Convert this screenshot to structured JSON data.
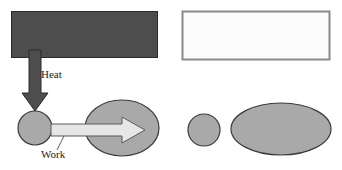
{
  "figure": {
    "title": "",
    "width": 342,
    "height": 170,
    "background": "#ffffff"
  },
  "labels": {
    "heat": "Heat",
    "work": "Work"
  },
  "colors": {
    "hot_reservoir_fill": "#4d4d4d",
    "hot_reservoir_stroke": "#2b2b2b",
    "cold_reservoir_fill": "#fbfbfb",
    "cold_reservoir_stroke": "#8a8a8a",
    "body_fill": "#a9a9a9",
    "body_stroke": "#3a3a3a",
    "heat_arrow_fill": "#4d4d4d",
    "heat_arrow_stroke": "#2b2b2b",
    "work_arrow_fill": "#e6e6e6",
    "work_arrow_stroke": "#5a5a5a",
    "text": "#1c1c1c"
  },
  "shapes": {
    "hot_reservoir": {
      "name": "hot-reservoir-rectangle",
      "x": 11,
      "y": 11,
      "width": 147,
      "height": 47,
      "state": "hot"
    },
    "cold_reservoir": {
      "name": "cold-reservoir-rectangle",
      "x": 182,
      "y": 11,
      "width": 148,
      "height": 49,
      "state": "cold"
    },
    "heat_arrow": {
      "name": "heat-arrow-down",
      "direction": "down",
      "from_x": 35,
      "from_y": 52,
      "to_x": 35,
      "to_y": 110
    },
    "small_circle_left": {
      "name": "small-body-before",
      "cx": 35,
      "cy": 128,
      "r": 17
    },
    "large_ellipse_left": {
      "name": "large-body-before",
      "cx": 122,
      "cy": 128,
      "rx": 37,
      "ry": 28
    },
    "work_arrow": {
      "name": "work-arrow-right",
      "direction": "right",
      "from_x": 52,
      "from_y": 130,
      "to_x": 143,
      "to_y": 130
    },
    "small_circle_right": {
      "name": "small-body-after",
      "cx": 204,
      "cy": 130,
      "r": 16
    },
    "large_ellipse_right": {
      "name": "large-body-after",
      "cx": 281,
      "cy": 129,
      "rx": 50,
      "ry": 26
    }
  },
  "label_positions": {
    "heat": {
      "x": 41,
      "y": 78
    },
    "work": {
      "x": 41,
      "y": 157
    }
  }
}
